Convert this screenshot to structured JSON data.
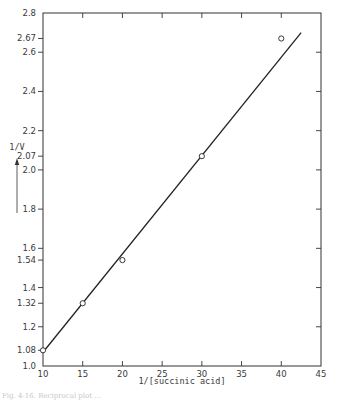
{
  "chart_data": {
    "type": "scatter",
    "title": "",
    "xlabel": "1/[succinic acid]",
    "ylabel": "1/V",
    "ylabel_arrow": "up",
    "xlim": [
      10,
      45
    ],
    "ylim": [
      1.0,
      2.8
    ],
    "grid": false,
    "legend": null,
    "x_ticks": [
      10,
      15,
      20,
      25,
      30,
      35,
      40,
      45
    ],
    "x_tick_labels": [
      "10",
      "15",
      "20",
      "25",
      "30",
      "35",
      "40",
      "45"
    ],
    "y_ticks": [
      1.0,
      1.08,
      1.2,
      1.32,
      1.4,
      1.54,
      1.6,
      1.8,
      2.0,
      2.07,
      2.2,
      2.4,
      2.6,
      2.67,
      2.8
    ],
    "y_tick_labels": [
      "1.0",
      "1.08",
      "1.2",
      "1.32",
      "1.4",
      "1.54",
      "1.6",
      "1.8",
      "2.0",
      "2.07",
      "2.2",
      "2.4",
      "2.6",
      "2.67",
      "2.8"
    ],
    "series": [
      {
        "name": "observed",
        "marker": "open-circle",
        "x": [
          10,
          15,
          20,
          30,
          40
        ],
        "y": [
          1.08,
          1.32,
          1.54,
          2.07,
          2.67
        ]
      },
      {
        "name": "fit line",
        "style": "line",
        "x": [
          10,
          42.5
        ],
        "y": [
          1.07,
          2.7
        ]
      }
    ]
  },
  "caption": {
    "text": "Fig. 4-16. Reciprocal plot ..."
  }
}
